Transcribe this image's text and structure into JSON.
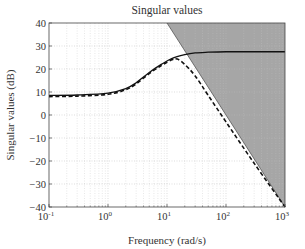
{
  "chart_data": {
    "type": "line",
    "title": "Singular values",
    "xlabel": "Frequency (rad/s)",
    "ylabel": "Singular values (dB)",
    "xscale": "log",
    "xlim": [
      0.1,
      1000
    ],
    "ylim": [
      -40,
      40
    ],
    "xticks": [
      {
        "base": "10",
        "exp": "-1",
        "value": 0.1
      },
      {
        "base": "10",
        "exp": "0",
        "value": 1
      },
      {
        "base": "10",
        "exp": "1",
        "value": 10
      },
      {
        "base": "10",
        "exp": "2",
        "value": 100
      },
      {
        "base": "10",
        "exp": "3",
        "value": 1000
      }
    ],
    "yticks": [
      "40",
      "30",
      "20",
      "10",
      "0",
      "-10",
      "-20",
      "-30",
      "-40"
    ],
    "grid": true,
    "legend": null,
    "series": [
      {
        "name": "solid singular value",
        "style": "solid",
        "x": [
          0.1,
          0.3,
          1,
          2,
          3,
          5,
          8,
          12,
          20,
          30,
          50,
          100,
          300,
          1000
        ],
        "y": [
          8.5,
          8.7,
          9.5,
          11.5,
          14,
          18.5,
          22,
          24.5,
          26.2,
          27,
          27.3,
          27.5,
          27.5,
          27.5
        ]
      },
      {
        "name": "dashed singular value",
        "style": "dashed",
        "x": [
          0.1,
          0.3,
          1,
          2,
          3,
          5,
          8,
          12,
          15,
          20,
          30,
          50,
          100,
          300,
          1000
        ],
        "y": [
          8.0,
          8.2,
          9.0,
          11.0,
          13.5,
          18,
          21.5,
          24,
          24.3,
          22,
          17,
          8.5,
          -3,
          -21,
          -40
        ]
      }
    ],
    "shaded_region": {
      "description": "constraint region above -40 dB/decade line",
      "boundary_x": [
        10,
        1000
      ],
      "boundary_y": [
        40,
        -40
      ],
      "color": "#a6a6a6"
    }
  }
}
